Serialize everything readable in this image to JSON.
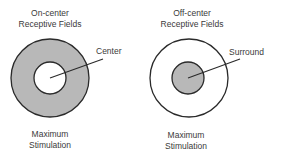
{
  "diagram": {
    "panels": [
      {
        "title_line1": "On-center",
        "title_line2": "Receptive Fields",
        "callout": "Center",
        "caption_line1": "Maximum",
        "caption_line2": "Stimulation",
        "outer_fill": "#b8b8b8",
        "inner_fill": "#ffffff"
      },
      {
        "title_line1": "Off-center",
        "title_line2": "Receptive Fields",
        "callout": "Surround",
        "caption_line1": "Maximum",
        "caption_line2": "Stimulation",
        "outer_fill": "#ffffff",
        "inner_fill": "#b8b8b8"
      }
    ],
    "colors": {
      "stroke": "#2a2a2a",
      "shade": "#b8b8b8",
      "background": "#ffffff"
    }
  }
}
